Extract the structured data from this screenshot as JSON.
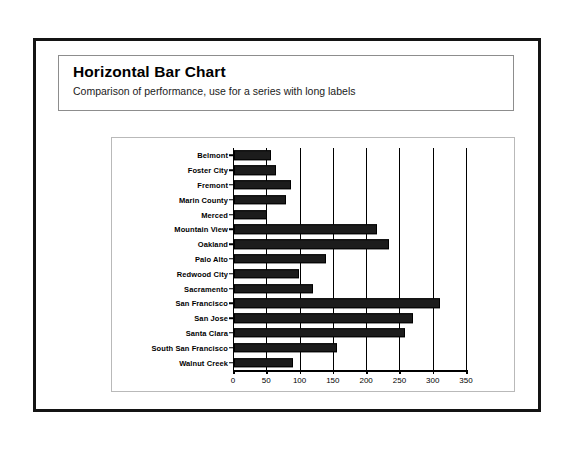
{
  "header": {
    "title": "Horizontal Bar Chart",
    "subtitle": "Comparison of performance, use for a series with long labels"
  },
  "colors": {
    "bar": "#1c1c1c",
    "frame": "#141414",
    "card_border": "#8d8d8d",
    "plot_border": "#b9b9b9",
    "axis": "#000000",
    "background": "#ffffff"
  },
  "chart_data": {
    "type": "bar",
    "orientation": "horizontal",
    "title": "Horizontal Bar Chart",
    "subtitle": "Comparison of performance, use for a series with long labels",
    "xlabel": "",
    "ylabel": "",
    "xlim": [
      0,
      350
    ],
    "xticks": [
      0,
      50,
      100,
      150,
      200,
      250,
      300,
      350
    ],
    "grid": true,
    "grid_axis": "x",
    "legend": false,
    "categories": [
      "Belmont",
      "Foster City",
      "Fremont",
      "Marin County",
      "Merced",
      "Mountain View",
      "Oakland",
      "Palo Alto",
      "Redwood City",
      "Sacramento",
      "San Francisco",
      "San Jose",
      "Santa Clara",
      "South San Francisco",
      "Walnut Creek"
    ],
    "values": [
      57,
      64,
      87,
      79,
      50,
      215,
      233,
      139,
      99,
      119,
      310,
      270,
      258,
      156,
      90
    ]
  }
}
